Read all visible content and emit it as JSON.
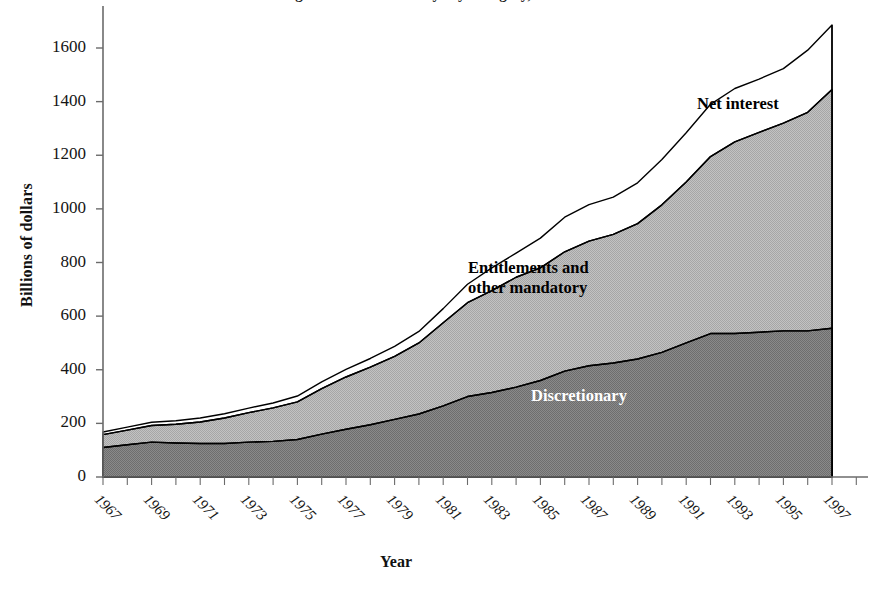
{
  "figure": {
    "title_cutoff": "Figure 1. Federal Outlays by Category, 1966-1996",
    "xlabel": "Year",
    "ylabel": "Billions of dollars"
  },
  "axes": {
    "y_ticks": [
      "0",
      "200",
      "400",
      "600",
      "800",
      "1000",
      "1200",
      "1400",
      "1600"
    ],
    "x_ticks": [
      "1967",
      "1969",
      "1971",
      "1973",
      "1975",
      "1977",
      "1979",
      "1981",
      "1983",
      "1985",
      "1987",
      "1989",
      "1991",
      "1993",
      "1995",
      "1997"
    ]
  },
  "series_labels": {
    "net_interest": "Net interest",
    "entitlements_line1": "Entitlements and",
    "entitlements_line2": "other mandatory",
    "discretionary": "Discretionary"
  },
  "colors": {
    "discretionary": "#7f7f7f",
    "entitlements": "#b5b5b5",
    "net_interest": "#ffffff",
    "outline": "#000000",
    "axis": "#6b6b6b",
    "text": "#111111",
    "discretionary_label_text": "#ffffff"
  },
  "chart_data": {
    "type": "area",
    "stacked": true,
    "title": "Federal Outlays by Category",
    "xlabel": "Year",
    "ylabel": "Billions of dollars",
    "ylim": [
      0,
      1800
    ],
    "xlim": [
      1966,
      1997
    ],
    "grid": false,
    "legend": "in-plot annotations",
    "x": [
      1966,
      1967,
      1968,
      1969,
      1970,
      1971,
      1972,
      1973,
      1974,
      1975,
      1976,
      1977,
      1978,
      1979,
      1980,
      1981,
      1982,
      1983,
      1984,
      1985,
      1986,
      1987,
      1988,
      1989,
      1990,
      1991,
      1992,
      1993,
      1994,
      1995,
      1996
    ],
    "series": [
      {
        "name": "Discretionary",
        "values": [
          110,
          120,
          130,
          127,
          125,
          125,
          130,
          133,
          140,
          160,
          178,
          195,
          215,
          235,
          265,
          300,
          315,
          335,
          360,
          395,
          415,
          425,
          440,
          465,
          500,
          535,
          535,
          540,
          545,
          545,
          555
        ]
      },
      {
        "name": "Entitlements and other mandatory",
        "values": [
          48,
          55,
          62,
          70,
          80,
          95,
          110,
          125,
          140,
          170,
          195,
          215,
          235,
          265,
          310,
          350,
          380,
          410,
          420,
          445,
          465,
          480,
          505,
          550,
          600,
          660,
          715,
          745,
          775,
          815,
          890
        ]
      },
      {
        "name": "Net interest",
        "values": [
          10,
          11,
          12,
          13,
          15,
          16,
          17,
          18,
          22,
          25,
          28,
          32,
          37,
          43,
          53,
          69,
          85,
          90,
          111,
          129,
          136,
          139,
          152,
          169,
          184,
          195,
          199,
          199,
          203,
          232,
          241
        ]
      }
    ],
    "totals": [
      168,
      186,
      204,
      210,
      220,
      236,
      257,
      276,
      302,
      355,
      401,
      442,
      487,
      543,
      628,
      719,
      780,
      835,
      891,
      969,
      1016,
      1044,
      1097,
      1184,
      1284,
      1390,
      1449,
      1484,
      1523,
      1592,
      1686
    ]
  }
}
